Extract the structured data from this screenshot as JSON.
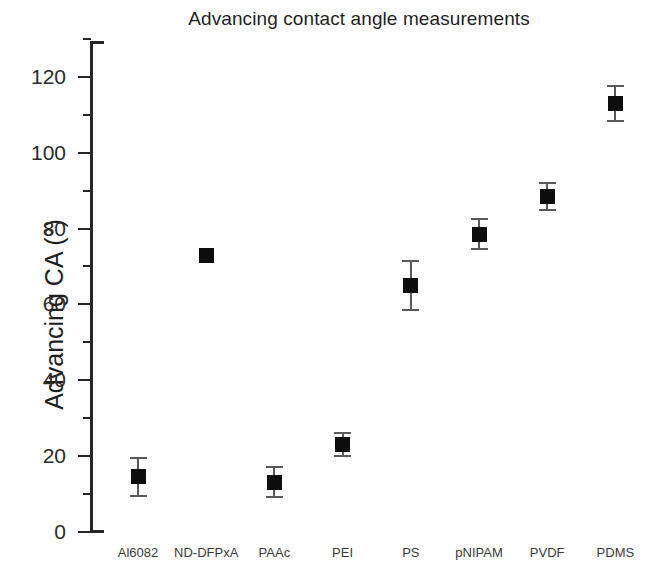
{
  "chart_data": {
    "type": "scatter",
    "title": "Advancing contact angle measurements",
    "xlabel": "",
    "ylabel": "Advancing CA (°)",
    "ylim": [
      0,
      130
    ],
    "ytick_major": [
      0,
      20,
      40,
      60,
      80,
      100,
      120
    ],
    "ytick_minor": [
      10,
      30,
      50,
      70,
      90,
      110,
      130
    ],
    "ytick_labels": [
      "0",
      "20",
      "40",
      "60",
      "80",
      "100",
      "120"
    ],
    "grid": false,
    "legend": null,
    "marker": "filled-square",
    "marker_color": "#0d0d0d",
    "errorbar_color": "#5a5a5a",
    "categories": [
      "Al6082",
      "ND-DFPxA",
      "PAAc",
      "PEI",
      "PS",
      "pNIPAM",
      "PVDF",
      "PDMS"
    ],
    "values": [
      14.5,
      73,
      13,
      23,
      65,
      78.5,
      88.5,
      113
    ],
    "errors": [
      5,
      0,
      4,
      3,
      6.5,
      4,
      3.5,
      4.5
    ],
    "series": [
      {
        "name": "Advancing CA",
        "points": [
          {
            "category": "Al6082",
            "value": 14.5,
            "error": 5
          },
          {
            "category": "ND-DFPxA",
            "value": 73,
            "error": 0
          },
          {
            "category": "PAAc",
            "value": 13,
            "error": 4
          },
          {
            "category": "PEI",
            "value": 23,
            "error": 3
          },
          {
            "category": "PS",
            "value": 65,
            "error": 6.5
          },
          {
            "category": "pNIPAM",
            "value": 78.5,
            "error": 4
          },
          {
            "category": "PVDF",
            "value": 88.5,
            "error": 3.5
          },
          {
            "category": "PDMS",
            "value": 113,
            "error": 4.5
          }
        ]
      }
    ]
  }
}
